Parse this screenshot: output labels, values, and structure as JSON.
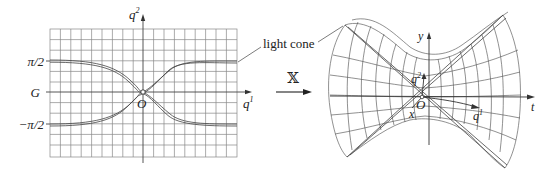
{
  "left_panel": {
    "axis_vertical_label": "q",
    "axis_vertical_sup": "2",
    "axis_horizontal_label": "q",
    "axis_horizontal_sup": "1",
    "origin_label": "O",
    "y_tick_labels": [
      "π/2",
      "G",
      "−π/2"
    ],
    "curve_description": "two light-cone curves crossing at O, asymptotic to ±π/2"
  },
  "annotation": {
    "light_cone_label": "light cone"
  },
  "operator": {
    "symbol": "𝕏"
  },
  "right_panel": {
    "axis_y_label": "y",
    "axis_t_label": "t",
    "axis_x_label": "x",
    "q2_label": "q",
    "q2_sup": "2",
    "q1_label": "q",
    "q1_sup": "1",
    "origin_label": "O",
    "surface_description": "hyperboloid of one sheet with mesh grid and light-cone lines"
  },
  "colors": {
    "line": "#444444",
    "grid": "#777777",
    "text": "#222222"
  }
}
